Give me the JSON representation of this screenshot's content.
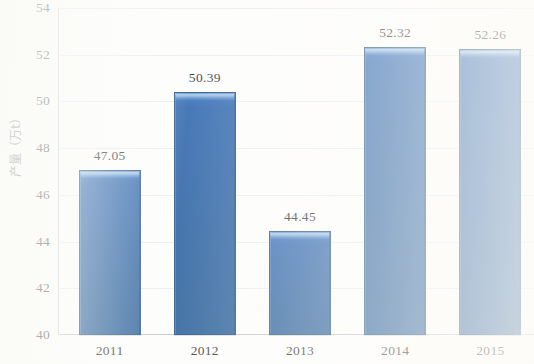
{
  "chart_data": {
    "type": "bar",
    "title": "",
    "subtitle": "",
    "xlabel": "",
    "ylabel": "产量（万t）",
    "categories": [
      "2011",
      "2012",
      "2013",
      "2014",
      "2015"
    ],
    "values": [
      47.05,
      50.39,
      44.45,
      52.32,
      52.26
    ],
    "value_labels": [
      "47.05",
      "50.39",
      "44.45",
      "52.32",
      "52.26"
    ],
    "ylim": [
      40,
      54
    ],
    "ytick_step": 2,
    "yticks": [
      "54",
      "52",
      "50",
      "48",
      "46",
      "44",
      "42",
      "40"
    ],
    "ytick_values": [
      54,
      52,
      50,
      48,
      46,
      44,
      42,
      40
    ],
    "grid": true,
    "grid_axis": "y",
    "legend": false,
    "legend_position": "none",
    "series": [
      {
        "name": "产量（万t）",
        "values": [
          47.05,
          50.39,
          44.45,
          52.32,
          52.26
        ]
      }
    ],
    "colors": {
      "bar_fill": "#1a58a6",
      "bar_highlight": "#5b91cf",
      "bar_border": "#0f3f73",
      "gridline": "#e3e7ec",
      "axis": "#b9bfc7",
      "text": "#1c1c1c",
      "background": "#fdfdfb"
    }
  }
}
